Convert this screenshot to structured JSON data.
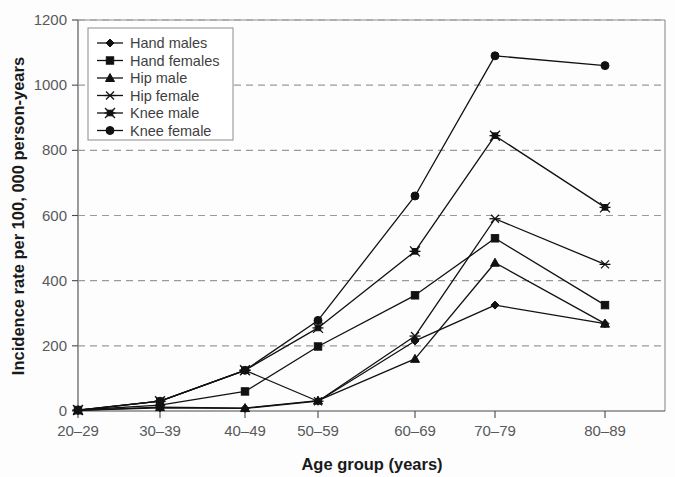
{
  "chart_data": {
    "type": "line",
    "title": "",
    "xlabel": "Age group (years)",
    "ylabel": "Incidence rate per 100, 000 person-years",
    "categories": [
      "20–29",
      "30–39",
      "40–49",
      "50–59",
      "60–69",
      "70–79",
      "80–89"
    ],
    "xtick_labels": [
      "20–29",
      "30–39",
      "40–49",
      "50–59",
      "60–69",
      "70–79",
      "80–89"
    ],
    "ytick_labels": [
      "0",
      "200",
      "400",
      "600",
      "800",
      "1000",
      "1200"
    ],
    "yticks": [
      0,
      200,
      400,
      600,
      800,
      1000,
      1200
    ],
    "ylim": [
      0,
      1200
    ],
    "grid": "horizontal-dashed",
    "legend_position": "top-left",
    "series": [
      {
        "name": "Hand males",
        "marker": "diamond",
        "values": [
          2,
          10,
          8,
          30,
          215,
          325,
          268
        ]
      },
      {
        "name": "Hand females",
        "marker": "square",
        "values": [
          3,
          18,
          60,
          198,
          355,
          530,
          325
        ]
      },
      {
        "name": "Hip male",
        "marker": "triangle",
        "values": [
          2,
          12,
          9,
          32,
          160,
          455,
          268
        ]
      },
      {
        "name": "Hip female",
        "marker": "cross",
        "values": [
          2,
          30,
          125,
          30,
          230,
          590,
          450
        ]
      },
      {
        "name": "Knee male",
        "marker": "star",
        "values": [
          3,
          30,
          125,
          255,
          490,
          845,
          625
        ]
      },
      {
        "name": "Knee female",
        "marker": "circle",
        "values": [
          3,
          30,
          125,
          278,
          660,
          1090,
          1060
        ]
      }
    ]
  },
  "legend": {
    "entries": [
      "Hand males",
      "Hand females",
      "Hip male",
      "Hip female",
      "Knee male",
      "Knee female"
    ]
  }
}
